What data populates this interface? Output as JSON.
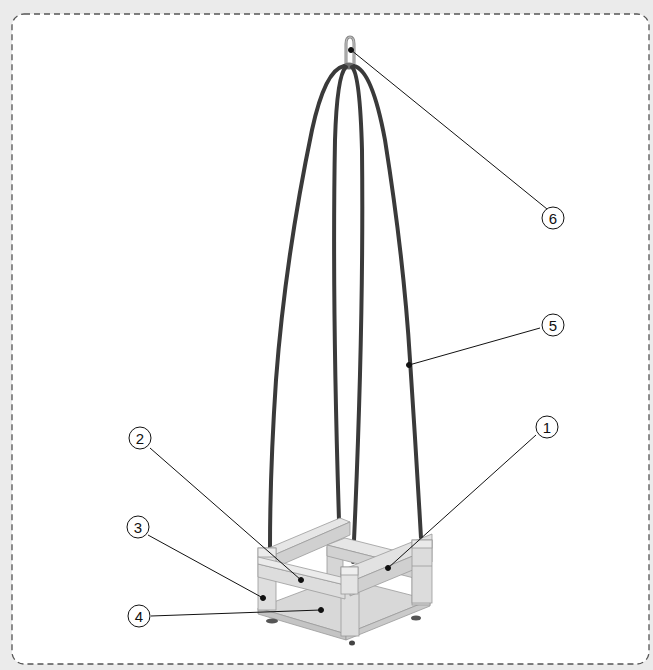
{
  "diagram": {
    "type": "exploded-parts-callout",
    "colors": {
      "page_background": "#ebebeb",
      "panel_background": "#ffffff",
      "frame_dash": "#555555",
      "rope": "#3a3a3a",
      "wood_light": "#e4e4e4",
      "wood_mid": "#d2d2d2",
      "wood_dark": "#bdbdbd",
      "leader_line": "#111111"
    },
    "callouts": [
      {
        "id": "1",
        "label": "1",
        "part": "front-bar"
      },
      {
        "id": "2",
        "label": "2",
        "part": "side-bar"
      },
      {
        "id": "3",
        "label": "3",
        "part": "corner-post"
      },
      {
        "id": "4",
        "label": "4",
        "part": "seat-board"
      },
      {
        "id": "5",
        "label": "5",
        "part": "rope"
      },
      {
        "id": "6",
        "label": "6",
        "part": "hanging-hook"
      }
    ]
  }
}
